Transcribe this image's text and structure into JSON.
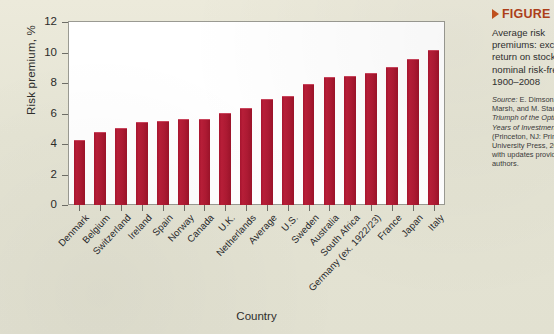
{
  "chart_data": {
    "type": "bar",
    "title": "",
    "xlabel": "Country",
    "ylabel": "Risk premium, %",
    "ylim": [
      0,
      12
    ],
    "yticks": [
      0,
      2,
      4,
      6,
      8,
      10,
      12
    ],
    "grid": false,
    "legend": "none",
    "bar_color": "#b01c35",
    "categories": [
      "Denmark",
      "Belgium",
      "Switzerland",
      "Ireland",
      "Spain",
      "Norway",
      "Canada",
      "U.K.",
      "Netherlands",
      "Average",
      "U.S.",
      "Sweden",
      "Australia",
      "South Africa",
      "Germany (ex. 1922/23)",
      "France",
      "Japan",
      "Italy"
    ],
    "values": [
      4.2,
      4.7,
      5.0,
      5.4,
      5.45,
      5.6,
      5.6,
      6.0,
      6.3,
      6.9,
      7.1,
      7.9,
      8.3,
      8.4,
      8.6,
      9.0,
      9.5,
      10.1
    ]
  },
  "caption": {
    "figure_label": "FIGURE",
    "description": "Average risk\npremiums: excess\nreturn on stocks over\nnominal risk-free rate,\n1900–2008",
    "source_prefix": "Source:",
    "source_text": "E. Dimson, P.\nMarsh, and M. Staunton,\nTriumph of the Optimists: 101\nYears of Investment Returns\n(Princeton, NJ: Princeton\nUniversity Press, 2002),\nwith updates provided by the\nauthors."
  },
  "colors": {
    "page_background": "#e5e4d4",
    "plot_background": "#ffffff",
    "bar": "#b01c35",
    "accent": "#b0401a",
    "axis": "#6d6d66"
  }
}
